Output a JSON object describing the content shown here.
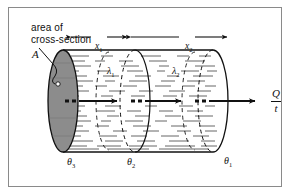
{
  "figure": {
    "type": "physics-diagram",
    "border_color": "#8a8a8a",
    "background": "#ffffff",
    "ink_color": "#111111"
  },
  "annotations": {
    "area_caption_line1": "area of",
    "area_caption_line2": "cross-section",
    "area_symbol": "A",
    "leader_target": "left end face of cylinder"
  },
  "dimensions": [
    {
      "name": "x1",
      "label": "x",
      "subscript": "1",
      "span": "left section length"
    },
    {
      "name": "x2",
      "label": "x",
      "subscript": "2",
      "span": "right section length"
    }
  ],
  "conductivities": [
    {
      "name": "lambda1",
      "label": "λ",
      "subscript": "1",
      "section": "left"
    },
    {
      "name": "lambda2",
      "label": "λ",
      "subscript": "2",
      "section": "right"
    }
  ],
  "temperatures": [
    {
      "name": "theta3",
      "label": "θ",
      "subscript": "3",
      "position": "left face"
    },
    {
      "name": "theta2",
      "label": "θ",
      "subscript": "2",
      "position": "interface"
    },
    {
      "name": "theta1",
      "label": "θ",
      "subscript": "1",
      "position": "right face"
    }
  ],
  "heat_flow": {
    "numerator": "Q",
    "denominator": "t",
    "direction": "left-to-right"
  },
  "colors": {
    "end_cap_fill": "#8d8d8d",
    "hatching": "#3a3a3a",
    "outline": "#111111"
  }
}
